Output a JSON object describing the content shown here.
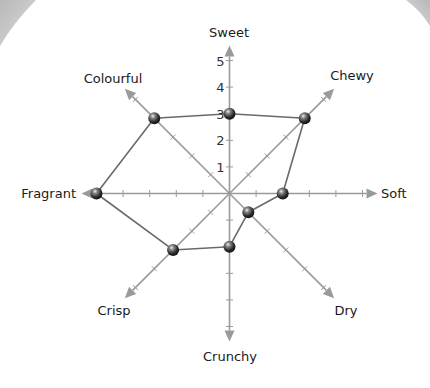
{
  "chart_data": {
    "type": "radar",
    "title": "",
    "axes": [
      "Sweet",
      "Chewy",
      "Soft",
      "Dry",
      "Crunchy",
      "Crisp",
      "Fragrant",
      "Colourful"
    ],
    "series": [
      {
        "name": "Profile",
        "values": [
          3,
          4,
          2,
          1,
          2,
          3,
          5,
          4
        ]
      }
    ],
    "rlim": [
      0,
      5
    ],
    "radial_ticks": [
      "1",
      "2",
      "3",
      "4",
      "5"
    ],
    "grid": false,
    "legend": null
  },
  "style": {
    "axis_color": "#9a9a9a",
    "polygon_color": "#6a6a6a",
    "marker_color": "#2b2b2b",
    "corner_shade": "#c4c4c4"
  }
}
